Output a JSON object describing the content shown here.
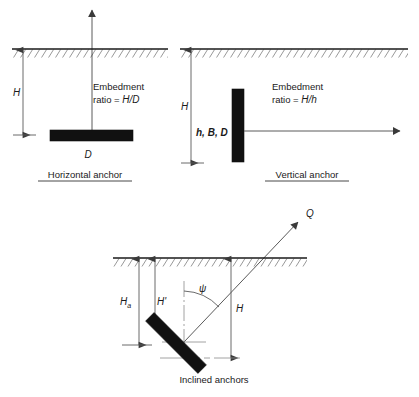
{
  "figure": {
    "title": "",
    "panels": [
      {
        "id": "horizontal-anchor",
        "caption": "Horizontal anchor",
        "labels": {
          "depth": "H",
          "width": "D",
          "ratio_line1": "Embedment",
          "ratio_line2_prefix": "ratio = ",
          "ratio_line2_value": "H/D"
        }
      },
      {
        "id": "vertical-anchor",
        "caption": "Vertical anchor",
        "labels": {
          "depth": "H",
          "dims": "h, B, D",
          "ratio_line1": "Embedment",
          "ratio_line2_prefix": "ratio = ",
          "ratio_line2_value": "H/h"
        }
      },
      {
        "id": "inclined-anchors",
        "caption": "Inclined anchors",
        "labels": {
          "depth_a": "H",
          "depth_a_sub": "a",
          "depth_prime": "H'",
          "depth_h": "H",
          "angle": "ψ",
          "load": "Q"
        }
      }
    ]
  },
  "colors": {
    "plate": "#111111",
    "ground": "#1a1a1a",
    "dimension": "#5a5a5a",
    "centerline": "#8a8a8a",
    "background": "#ffffff"
  }
}
